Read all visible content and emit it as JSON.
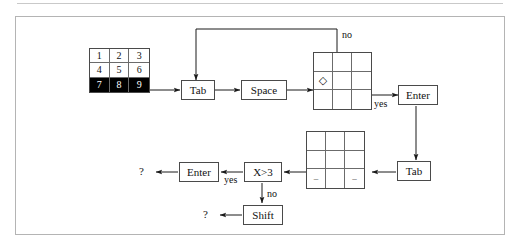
{
  "figure": {
    "type": "flowchart",
    "title_rule": true,
    "background": "#ffffff",
    "border_color": "#b4b4b4",
    "ink_color": "#1a1a1a"
  },
  "grids": {
    "numbered": {
      "name": "numbered-grid",
      "rows": [
        [
          "1",
          "2",
          "3"
        ],
        [
          "4",
          "5",
          "6"
        ],
        [
          "7",
          "8",
          "9"
        ]
      ],
      "highlighted_row_index": 2,
      "highlight_bg": "#000000",
      "highlight_fg": "#ffffff"
    },
    "diamond": {
      "name": "diamond-grid",
      "rows": [
        [
          "",
          "",
          ""
        ],
        [
          "◇",
          "",
          ""
        ],
        [
          "",
          "",
          ""
        ]
      ]
    },
    "dashes": {
      "name": "dashes-grid",
      "rows": [
        [
          "",
          "",
          ""
        ],
        [
          "",
          "",
          ""
        ],
        [
          "–",
          "",
          "–"
        ]
      ]
    }
  },
  "nodes": {
    "tab_top": "Tab",
    "space": "Space",
    "enter_right": "Enter",
    "tab_right": "Tab",
    "x_gt_3": "X>3",
    "enter_left": "Enter",
    "shift": "Shift"
  },
  "edge_labels": {
    "no_top": "no",
    "yes_right": "yes",
    "yes_bottom": "yes",
    "no_bottom": "no"
  },
  "terminals": {
    "q_enter": "?",
    "q_shift": "?"
  }
}
